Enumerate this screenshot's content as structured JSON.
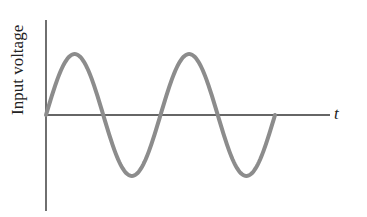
{
  "diagram": {
    "y_axis_label": "Input voltage",
    "x_axis_label": "t",
    "curve": "sine wave, two full periods, starting at origin going positive",
    "colors": {
      "axes": "#333333",
      "curve": "#8c8c8c"
    }
  },
  "chart_data": {
    "type": "line",
    "title": "",
    "xlabel": "t",
    "ylabel": "Input voltage",
    "series": [
      {
        "name": "Input voltage",
        "function": "sin",
        "periods": 2,
        "amplitude": 1
      }
    ],
    "grid": false
  }
}
